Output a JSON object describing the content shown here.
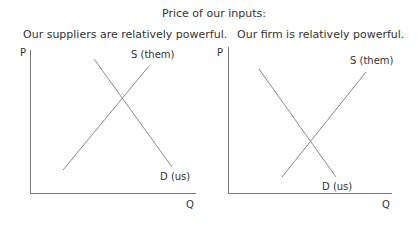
{
  "title": "Price of our inputs:",
  "charts": [
    {
      "subtitle": "Our suppliers are relatively powerful.",
      "y_axis_label": "P",
      "x_axis_label": "Q",
      "supply_label": "S (them)",
      "demand_label": "D (us)"
    },
    {
      "subtitle": "Our firm is relatively powerful.",
      "y_axis_label": "P",
      "x_axis_label": "Q",
      "supply_label": "S (them)",
      "demand_label": "D (us)"
    }
  ],
  "colors": {
    "line": "#8a8a8a",
    "axis": "#7a7a7a",
    "text": "#333333"
  }
}
